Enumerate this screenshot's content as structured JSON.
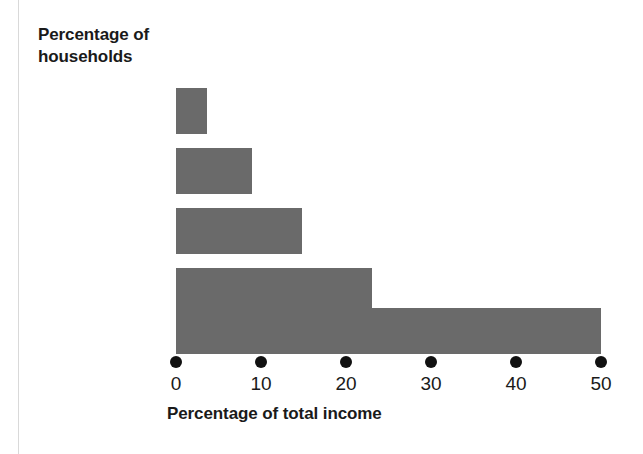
{
  "figure": {
    "background_color": "#ffffff",
    "left_rule_color": "#d9d9d9",
    "width": 643,
    "height": 454
  },
  "title": {
    "line1": "Percentage of",
    "line2": "households"
  },
  "axis": {
    "x_title": "Percentage of total income",
    "tick_labels": [
      "0",
      "10",
      "20",
      "30",
      "40",
      "50"
    ],
    "tick_values": [
      0,
      10,
      20,
      30,
      40,
      50
    ],
    "tick_marker_style": "dot",
    "tick_marker_color": "#111111"
  },
  "bars": {
    "color": "#6a6a6a"
  },
  "chart_data": {
    "type": "bar",
    "orientation": "horizontal",
    "title": "Percentage of households",
    "xlabel": "Percentage of total income",
    "ylabel": "Percentage of households",
    "categories": [
      "Lowest fifth",
      "Second fifth",
      "Middle fifth",
      "Next highest fifth",
      "Highest fifth"
    ],
    "values": [
      3.6,
      8.9,
      14.8,
      23.0,
      50.0
    ],
    "xlim": [
      0,
      50
    ],
    "xticks": [
      0,
      10,
      20,
      30,
      40,
      50
    ],
    "grid": false,
    "legend": false,
    "bar_color": "#6a6a6a"
  }
}
